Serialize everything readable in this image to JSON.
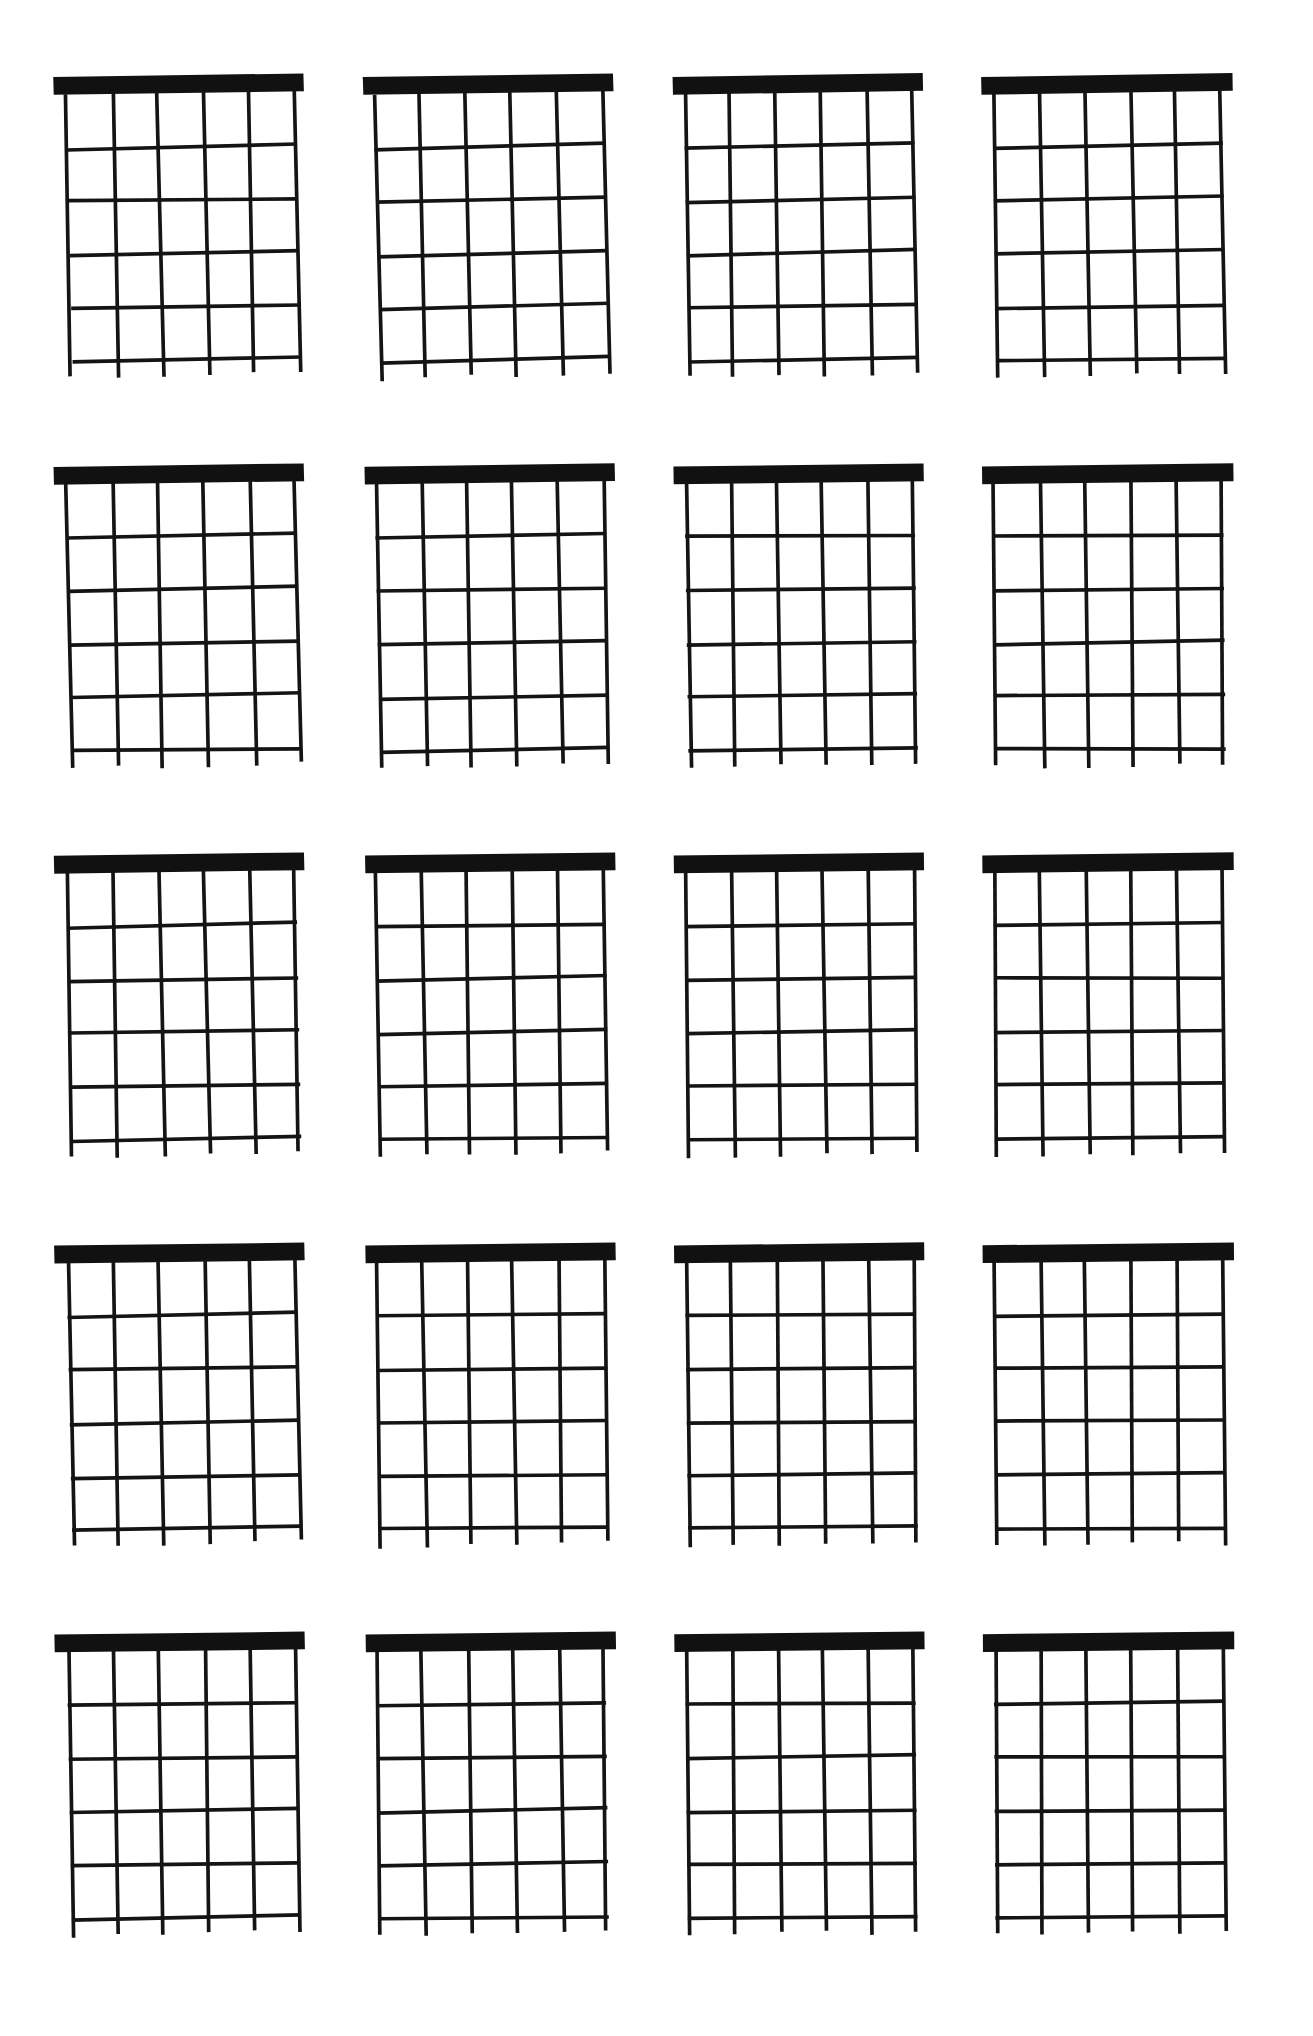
{
  "document": {
    "title": "Blank Guitar Chord Chart Sheet",
    "kind": "blank-chord-diagram-worksheet",
    "background_color": "#ffffff",
    "ink_color": "#141414",
    "nut_color": "#111111",
    "page_width": 1313,
    "page_height": 2036
  },
  "layout": {
    "columns": 4,
    "rows": 5,
    "diagram_count": 20,
    "margin_left": 40,
    "margin_right": 40,
    "margin_top": 48,
    "margin_bottom": 40
  },
  "diagram_spec": {
    "strings": 6,
    "frets": 5,
    "fret_lines": 5,
    "has_nut": true,
    "nut_thickness": 15,
    "string_labels": [
      "E",
      "A",
      "D",
      "G",
      "B",
      "e"
    ],
    "fret_numbers": [
      1,
      2,
      3,
      4,
      5
    ],
    "string_overhang_below_last_fret": 14,
    "nut_overhang_left": 10,
    "nut_overhang_right": 10
  },
  "diagrams": [
    {
      "id": 1,
      "row": 1,
      "col": 1,
      "label": "",
      "tilt_deg": -1.6,
      "skew_deg": -1.1,
      "nut_left_pad": 11,
      "nut_right_pad": 8
    },
    {
      "id": 2,
      "row": 1,
      "col": 2,
      "label": "",
      "tilt_deg": -1.9,
      "skew_deg": -1.4,
      "nut_left_pad": 9,
      "nut_right_pad": 10
    },
    {
      "id": 3,
      "row": 1,
      "col": 3,
      "label": "",
      "tilt_deg": -1.2,
      "skew_deg": -0.6,
      "nut_left_pad": 10,
      "nut_right_pad": 9
    },
    {
      "id": 4,
      "row": 1,
      "col": 4,
      "label": "",
      "tilt_deg": -1.0,
      "skew_deg": -0.4,
      "nut_left_pad": 10,
      "nut_right_pad": 10
    },
    {
      "id": 5,
      "row": 2,
      "col": 1,
      "label": "",
      "tilt_deg": -1.5,
      "skew_deg": -1.0,
      "nut_left_pad": 11,
      "nut_right_pad": 8
    },
    {
      "id": 6,
      "row": 2,
      "col": 2,
      "label": "",
      "tilt_deg": -1.3,
      "skew_deg": -0.8,
      "nut_left_pad": 9,
      "nut_right_pad": 10
    },
    {
      "id": 7,
      "row": 2,
      "col": 3,
      "label": "",
      "tilt_deg": -0.9,
      "skew_deg": -0.5,
      "nut_left_pad": 10,
      "nut_right_pad": 9
    },
    {
      "id": 8,
      "row": 2,
      "col": 4,
      "label": "",
      "tilt_deg": -0.7,
      "skew_deg": -0.3,
      "nut_left_pad": 10,
      "nut_right_pad": 10
    },
    {
      "id": 9,
      "row": 3,
      "col": 1,
      "label": "",
      "tilt_deg": -1.4,
      "skew_deg": -0.9,
      "nut_left_pad": 11,
      "nut_right_pad": 8
    },
    {
      "id": 10,
      "row": 3,
      "col": 2,
      "label": "",
      "tilt_deg": -1.1,
      "skew_deg": -0.7,
      "nut_left_pad": 9,
      "nut_right_pad": 10
    },
    {
      "id": 11,
      "row": 3,
      "col": 3,
      "label": "",
      "tilt_deg": -0.8,
      "skew_deg": -0.4,
      "nut_left_pad": 10,
      "nut_right_pad": 9
    },
    {
      "id": 12,
      "row": 3,
      "col": 4,
      "label": "",
      "tilt_deg": -0.6,
      "skew_deg": -0.2,
      "nut_left_pad": 10,
      "nut_right_pad": 10
    },
    {
      "id": 13,
      "row": 4,
      "col": 1,
      "label": "",
      "tilt_deg": -1.3,
      "skew_deg": -0.9,
      "nut_left_pad": 11,
      "nut_right_pad": 8
    },
    {
      "id": 14,
      "row": 4,
      "col": 2,
      "label": "",
      "tilt_deg": -1.0,
      "skew_deg": -0.6,
      "nut_left_pad": 9,
      "nut_right_pad": 10
    },
    {
      "id": 15,
      "row": 4,
      "col": 3,
      "label": "",
      "tilt_deg": -0.7,
      "skew_deg": -0.3,
      "nut_left_pad": 10,
      "nut_right_pad": 9
    },
    {
      "id": 16,
      "row": 4,
      "col": 4,
      "label": "",
      "tilt_deg": -0.5,
      "skew_deg": -0.2,
      "nut_left_pad": 10,
      "nut_right_pad": 10
    },
    {
      "id": 17,
      "row": 5,
      "col": 1,
      "label": "",
      "tilt_deg": -1.2,
      "skew_deg": -0.8,
      "nut_left_pad": 11,
      "nut_right_pad": 8
    },
    {
      "id": 18,
      "row": 5,
      "col": 2,
      "label": "",
      "tilt_deg": -0.9,
      "skew_deg": -0.5,
      "nut_left_pad": 9,
      "nut_right_pad": 10
    },
    {
      "id": 19,
      "row": 5,
      "col": 3,
      "label": "",
      "tilt_deg": -0.6,
      "skew_deg": -0.3,
      "nut_left_pad": 10,
      "nut_right_pad": 9
    },
    {
      "id": 20,
      "row": 5,
      "col": 4,
      "label": "",
      "tilt_deg": -0.4,
      "skew_deg": -0.1,
      "nut_left_pad": 10,
      "nut_right_pad": 10
    }
  ]
}
